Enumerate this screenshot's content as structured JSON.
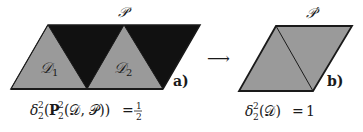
{
  "colors": {
    "dark_region": "#111111",
    "gray_region": "#9a9a9a",
    "stroke": "#1a1a1a",
    "background": "#ffffff"
  },
  "panel_a": {
    "polygon_label": "𝒫",
    "triangle_labels": [
      "𝒟",
      "𝒟"
    ],
    "triangle_subscripts": [
      "1",
      "2"
    ],
    "panel_label": "a)",
    "formula": {
      "delta": "δ",
      "delta_sup": "2",
      "delta_sub": "2",
      "open": "(",
      "P": "P",
      "P_sup": "2",
      "P_sub": "2",
      "args": "(𝒟, 𝒫))",
      "equals": "=",
      "frac_num": "1",
      "frac_den": "2"
    }
  },
  "arrow": "⟶",
  "panel_b": {
    "polygon_label": "𝒫′",
    "panel_label": "b)",
    "formula": {
      "delta": "δ",
      "delta_sup": "2",
      "delta_sub": "2",
      "args": "(𝒟)",
      "equals": "=",
      "value": "1"
    }
  }
}
